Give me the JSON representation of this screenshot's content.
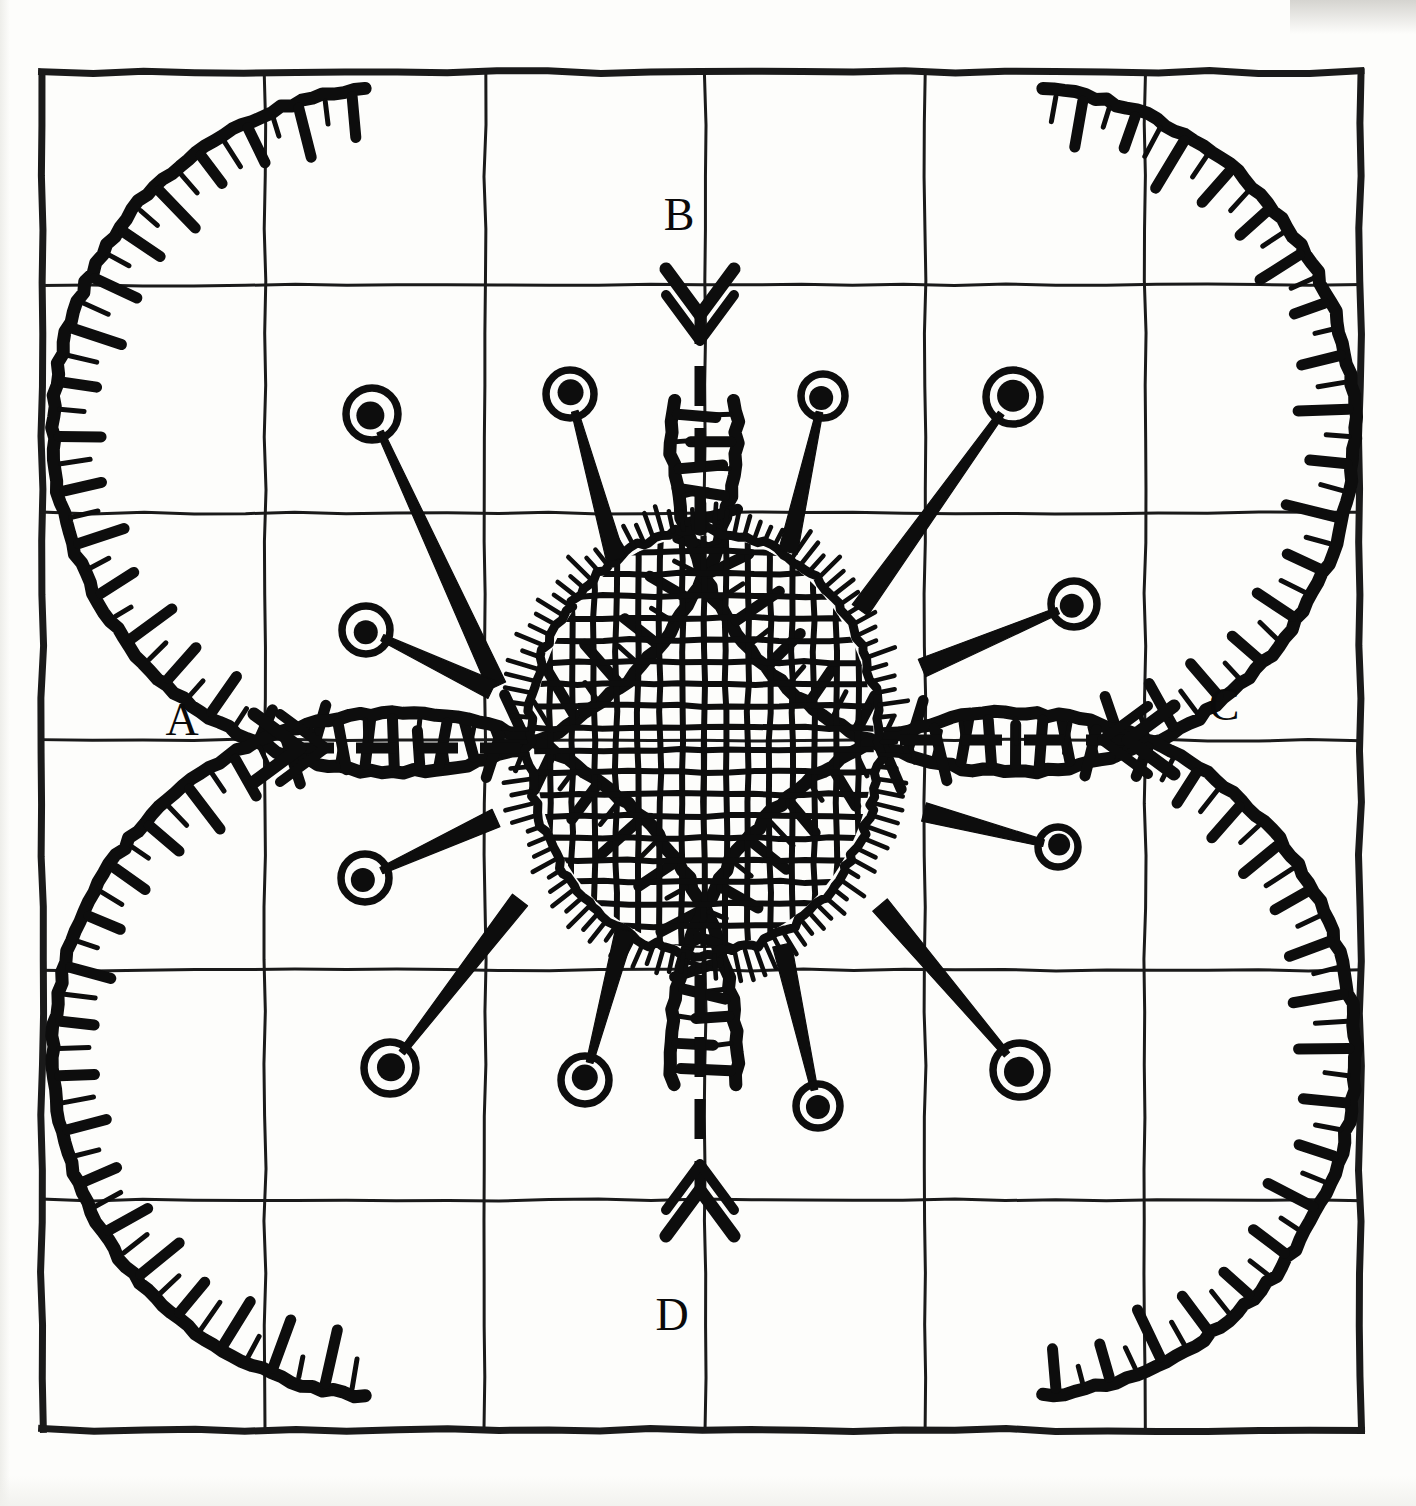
{
  "figure": {
    "title": "Quatrefoil radial diagram",
    "ink_color": "#0d0d0d",
    "grid_color": "#1a1a1a",
    "paper_color": "#fdfdfb"
  },
  "grid": {
    "name": "ruled-square-grid",
    "columns": 6,
    "rows": 6,
    "left": 42,
    "top": 72,
    "right": 1360,
    "bottom": 1430,
    "x_lines": [
      42,
      265,
      485,
      705,
      925,
      1145,
      1360
    ],
    "y_lines": [
      72,
      285,
      513,
      740,
      970,
      1200,
      1430
    ],
    "border_stroke_width": 7,
    "inner_stroke_width": 3
  },
  "center_disc": {
    "name": "central-hatched-disc",
    "cx": 704,
    "cy": 742,
    "rx": 176,
    "ry": 212,
    "hatch_spacing": 22,
    "hatch_stroke_width": 6,
    "outline_stroke_width": 9,
    "bristle_count": 108,
    "bristle_length": 22
  },
  "lobes": [
    {
      "name": "lobe-top-left",
      "cx": 395,
      "cy": 430,
      "r": 342,
      "gap_start_deg": 5,
      "gap_end_deg": 95
    },
    {
      "name": "lobe-top-right",
      "cx": 1013,
      "cy": 430,
      "r": 342,
      "gap_start_deg": 85,
      "gap_end_deg": 175
    },
    {
      "name": "lobe-bottom-left",
      "cx": 395,
      "cy": 1055,
      "r": 342,
      "gap_start_deg": 265,
      "gap_end_deg": 355
    },
    {
      "name": "lobe-bottom-right",
      "cx": 1013,
      "cy": 1055,
      "r": 342,
      "gap_start_deg": 185,
      "gap_end_deg": 275
    }
  ],
  "axes": [
    {
      "name": "axis-a",
      "label": "A",
      "direction": "left",
      "label_x": 182,
      "label_y": 735,
      "tip_x": 300,
      "tip_y": 748,
      "tail_x": 520,
      "tail_y": 748
    },
    {
      "name": "axis-b",
      "label": "B",
      "direction": "up",
      "label_x": 679,
      "label_y": 230,
      "tip_x": 700,
      "tip_y": 315,
      "tail_x": 700,
      "tail_y": 530
    },
    {
      "name": "axis-c",
      "label": "C",
      "direction": "right",
      "label_x": 1224,
      "label_y": 720,
      "tip_x": 1128,
      "tip_y": 740,
      "tail_x": 900,
      "tail_y": 740
    },
    {
      "name": "axis-d",
      "label": "D",
      "direction": "down",
      "label_x": 672,
      "label_y": 1330,
      "tip_x": 700,
      "tip_y": 1190,
      "tail_x": 700,
      "tail_y": 975
    }
  ],
  "pins": [
    {
      "name": "pin-1",
      "angle_deg": 118,
      "head_x": 372,
      "head_y": 414,
      "head_r": 26,
      "dot_r": 14,
      "base_x": 497,
      "base_y": 686
    },
    {
      "name": "pin-2",
      "angle_deg": 100,
      "head_x": 570,
      "head_y": 394,
      "head_r": 24,
      "dot_r": 13,
      "base_x": 616,
      "base_y": 560
    },
    {
      "name": "pin-3",
      "angle_deg": 78,
      "head_x": 823,
      "head_y": 396,
      "head_r": 22,
      "dot_r": 12,
      "base_x": 788,
      "base_y": 552
    },
    {
      "name": "pin-4",
      "angle_deg": 58,
      "head_x": 1013,
      "head_y": 397,
      "head_r": 27,
      "dot_r": 16,
      "base_x": 860,
      "base_y": 610
    },
    {
      "name": "pin-5",
      "angle_deg": 152,
      "head_x": 366,
      "head_y": 630,
      "head_r": 24,
      "dot_r": 12,
      "base_x": 492,
      "base_y": 690
    },
    {
      "name": "pin-6",
      "angle_deg": 26,
      "head_x": 1074,
      "head_y": 604,
      "head_r": 23,
      "dot_r": 12,
      "base_x": 922,
      "base_y": 668
    },
    {
      "name": "pin-7",
      "angle_deg": 202,
      "head_x": 365,
      "head_y": 878,
      "head_r": 24,
      "dot_r": 12,
      "base_x": 496,
      "base_y": 818
    },
    {
      "name": "pin-8",
      "angle_deg": 338,
      "head_x": 1058,
      "head_y": 847,
      "head_r": 20,
      "dot_r": 11,
      "base_x": 924,
      "base_y": 812
    },
    {
      "name": "pin-9",
      "angle_deg": 242,
      "head_x": 390,
      "head_y": 1068,
      "head_r": 26,
      "dot_r": 14,
      "base_x": 520,
      "base_y": 900
    },
    {
      "name": "pin-10",
      "angle_deg": 262,
      "head_x": 585,
      "head_y": 1080,
      "head_r": 24,
      "dot_r": 13,
      "base_x": 625,
      "base_y": 930
    },
    {
      "name": "pin-11",
      "angle_deg": 282,
      "head_x": 818,
      "head_y": 1106,
      "head_r": 22,
      "dot_r": 12,
      "base_x": 782,
      "base_y": 945
    },
    {
      "name": "pin-12",
      "angle_deg": 304,
      "head_x": 1020,
      "head_y": 1070,
      "head_r": 27,
      "dot_r": 15,
      "base_x": 880,
      "base_y": 905
    }
  ],
  "lobe_ticks": {
    "name": "lobe-tick-marks",
    "count_per_lobe": 58,
    "long_length": 44,
    "short_length": 26,
    "long_width": 11,
    "short_width": 5,
    "pattern": "alternating long-thick and short-thin inward radial ticks"
  }
}
